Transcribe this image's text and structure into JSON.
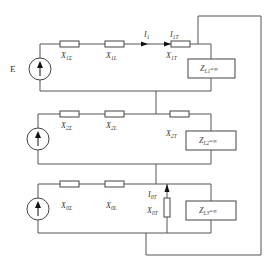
{
  "diagram": {
    "type": "three-sequence equivalent circuit",
    "source_label": "E",
    "positive_sequence": {
      "resistors": [
        "X1Σ",
        "X1L",
        "X1T"
      ],
      "resistor_label_parts": [
        {
          "main": "X",
          "sub": "1Σ"
        },
        {
          "main": "X",
          "sub": "1L"
        },
        {
          "main": "X",
          "sub": "1T"
        }
      ],
      "currents": [
        {
          "main": "I",
          "sub": "1"
        },
        {
          "main": "I",
          "sub": "1T"
        }
      ],
      "load": {
        "main": "Z",
        "sub": "L1",
        "suffix": "=∞"
      }
    },
    "negative_sequence": {
      "resistor_label_parts": [
        {
          "main": "X",
          "sub": "2Σ"
        },
        {
          "main": "X",
          "sub": "2L"
        },
        {
          "main": "X",
          "sub": "2T"
        }
      ],
      "load": {
        "main": "Z",
        "sub": "L2",
        "suffix": "=∞"
      }
    },
    "zero_sequence": {
      "resistor_label_parts": [
        {
          "main": "X",
          "sub": "0Σ"
        },
        {
          "main": "X",
          "sub": "0L"
        },
        {
          "main": "X",
          "sub": "0T"
        }
      ],
      "current": {
        "main": "I",
        "sub": "0T"
      },
      "load": {
        "main": "Z",
        "sub": "L3",
        "suffix": "=∞"
      }
    }
  }
}
